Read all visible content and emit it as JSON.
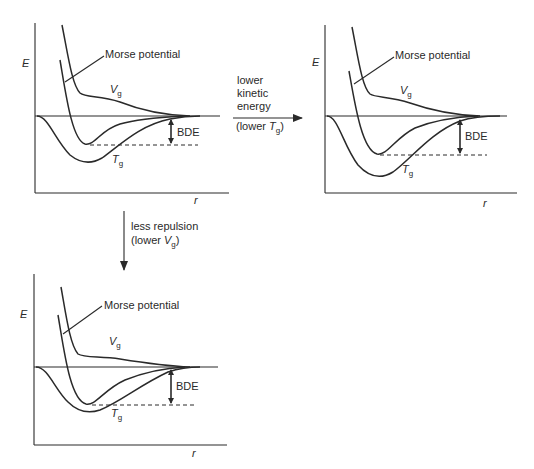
{
  "figure": {
    "panels": [
      {
        "id": "original",
        "axis_y_label": "E",
        "axis_x_label": "r",
        "curve_labels": {
          "morse": "Morse potential",
          "vg": "V",
          "vg_sub": "g",
          "tg": "T",
          "tg_sub": "g"
        },
        "bde_label": "BDE"
      },
      {
        "id": "lower-kinetic",
        "axis_y_label": "E",
        "axis_x_label": "r",
        "curve_labels": {
          "morse": "Morse potential",
          "vg": "V",
          "vg_sub": "g",
          "tg": "T",
          "tg_sub": "g"
        },
        "bde_label": "BDE"
      },
      {
        "id": "less-repulsion",
        "axis_y_label": "E",
        "axis_x_label": "r",
        "curve_labels": {
          "morse": "Morse potential",
          "vg": "V",
          "vg_sub": "g",
          "tg": "T",
          "tg_sub": "g"
        },
        "bde_label": "BDE"
      }
    ],
    "transitions": {
      "right": {
        "lines": [
          "lower",
          "kinetic",
          "energy"
        ],
        "paren_prefix": "(lower ",
        "paren_var": "T",
        "paren_sub": "g",
        "paren_suffix": ")"
      },
      "down": {
        "lines": [
          "less repulsion"
        ],
        "paren_prefix": "(lower ",
        "paren_var": "V",
        "paren_sub": "g",
        "paren_suffix": ")"
      }
    }
  }
}
